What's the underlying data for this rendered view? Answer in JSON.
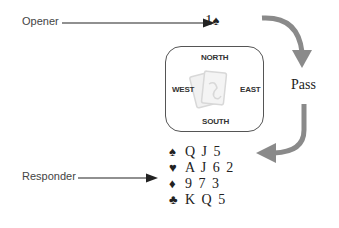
{
  "labels": {
    "opener": "Opener",
    "responder": "Responder"
  },
  "opening_bid": {
    "level": "1",
    "suit_icon": "spade-icon",
    "suit_glyph": "♠"
  },
  "table": {
    "north": "NORTH",
    "south": "SOUTH",
    "east": "EAST",
    "west": "WEST",
    "center_icon": "cards-icon"
  },
  "east_call": "Pass",
  "responder_hand": [
    {
      "suit": "spades",
      "glyph": "♠",
      "cards": "Q J 5"
    },
    {
      "suit": "hearts",
      "glyph": "♥",
      "cards": "A J 6 2"
    },
    {
      "suit": "diamonds",
      "glyph": "♦",
      "cards": "9 7 3"
    },
    {
      "suit": "clubs",
      "glyph": "♣",
      "cards": "K Q 5"
    }
  ],
  "colors": {
    "arrow_gray": "#8a8a8a",
    "line": "#222222",
    "table_border": "#555555"
  }
}
